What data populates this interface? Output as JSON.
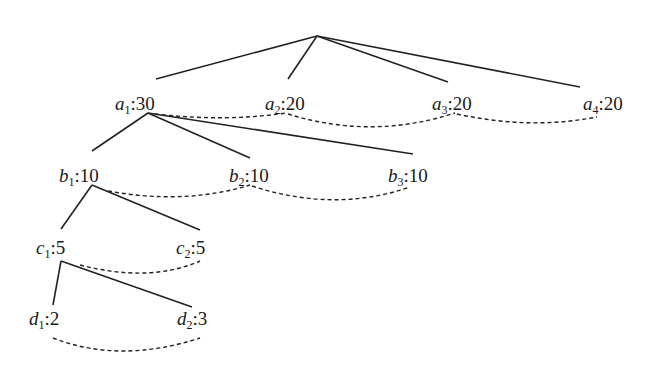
{
  "diagram": {
    "type": "tree",
    "root": {
      "x": 317,
      "y": 36
    },
    "nodes": [
      {
        "id": "a1",
        "letter": "a",
        "index": "1",
        "weight": "30",
        "level": 1,
        "x": 115,
        "y": 94
      },
      {
        "id": "a2",
        "letter": "a",
        "index": "2",
        "weight": "20",
        "level": 1,
        "x": 265,
        "y": 94
      },
      {
        "id": "a3",
        "letter": "a",
        "index": "3",
        "weight": "20",
        "level": 1,
        "x": 432,
        "y": 94
      },
      {
        "id": "a4",
        "letter": "a",
        "index": "4",
        "weight": "20",
        "level": 1,
        "x": 583,
        "y": 94
      },
      {
        "id": "b1",
        "letter": "b",
        "index": "1",
        "weight": "10",
        "level": 2,
        "x": 59,
        "y": 166
      },
      {
        "id": "b2",
        "letter": "b",
        "index": "2",
        "weight": "10",
        "level": 2,
        "x": 229,
        "y": 166
      },
      {
        "id": "b3",
        "letter": "b",
        "index": "3",
        "weight": "10",
        "level": 2,
        "x": 388,
        "y": 166
      },
      {
        "id": "c1",
        "letter": "c",
        "index": "1",
        "weight": "5",
        "level": 3,
        "x": 36,
        "y": 238
      },
      {
        "id": "c2",
        "letter": "c",
        "index": "2",
        "weight": "5",
        "level": 3,
        "x": 176,
        "y": 238
      },
      {
        "id": "d1",
        "letter": "d",
        "index": "1",
        "weight": "2",
        "level": 4,
        "x": 29,
        "y": 309
      },
      {
        "id": "d2",
        "letter": "d",
        "index": "2",
        "weight": "3",
        "level": 4,
        "x": 177,
        "y": 309
      }
    ],
    "edges": [
      {
        "from": "root",
        "to": "a1"
      },
      {
        "from": "root",
        "to": "a2"
      },
      {
        "from": "root",
        "to": "a3"
      },
      {
        "from": "root",
        "to": "a4"
      },
      {
        "from": "a1",
        "to": "b1"
      },
      {
        "from": "a1",
        "to": "b2"
      },
      {
        "from": "a1",
        "to": "b3"
      },
      {
        "from": "b1",
        "to": "c1"
      },
      {
        "from": "b1",
        "to": "c2"
      },
      {
        "from": "c1",
        "to": "d1"
      },
      {
        "from": "c1",
        "to": "d2"
      }
    ],
    "sibling_links": [
      {
        "from": "a1",
        "to": "a2"
      },
      {
        "from": "a2",
        "to": "a3"
      },
      {
        "from": "a3",
        "to": "a4"
      },
      {
        "from": "b1",
        "to": "b2"
      },
      {
        "from": "b2",
        "to": "b3"
      },
      {
        "from": "c1",
        "to": "c2"
      },
      {
        "from": "d1",
        "to": "d2"
      }
    ],
    "labels": {
      "a1": {
        "var": "a",
        "sub": "1",
        "val": ":30"
      },
      "a2": {
        "var": "a",
        "sub": "2",
        "val": ":20"
      },
      "a3": {
        "var": "a",
        "sub": "3",
        "val": ":20"
      },
      "a4": {
        "var": "a",
        "sub": "4",
        "val": ":20"
      },
      "b1": {
        "var": "b",
        "sub": "1",
        "val": ":10"
      },
      "b2": {
        "var": "b",
        "sub": "2",
        "val": ":10"
      },
      "b3": {
        "var": "b",
        "sub": "3",
        "val": ":10"
      },
      "c1": {
        "var": "c",
        "sub": "1",
        "val": ":5"
      },
      "c2": {
        "var": "c",
        "sub": "2",
        "val": ":5"
      },
      "d1": {
        "var": "d",
        "sub": "1",
        "val": ":2"
      },
      "d2": {
        "var": "d",
        "sub": "2",
        "val": ":3"
      }
    },
    "colors": {
      "line": "#222222",
      "text": "#1a1a1a",
      "background": "#ffffff"
    }
  }
}
